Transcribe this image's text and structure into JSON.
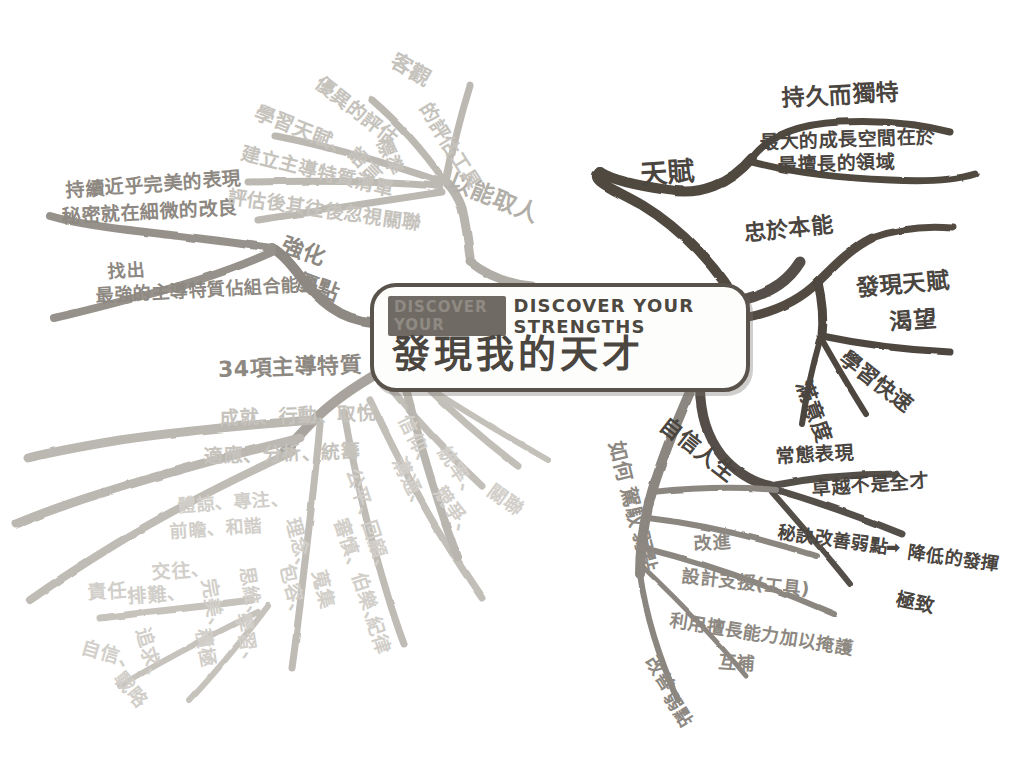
{
  "canvas": {
    "width": 1035,
    "height": 782,
    "background": "#ffffff",
    "style": "hand-drawn mind map, pencil and marker on white paper"
  },
  "palette": {
    "ink_dark": "#4a453f",
    "ink_mid": "#8d8881",
    "ink_light": "#b2aea8",
    "ink_faint": "#c6c3bd",
    "branch_dark": "#5a544d",
    "branch_mid": "#9b968f",
    "branch_light": "#bdb9b3"
  },
  "central": {
    "badge": "DISCOVER YOUR",
    "english_title": "DISCOVER YOUR STRENGTHS",
    "chinese_title": "發現我的天才"
  },
  "branches": [
    {
      "id": "talent",
      "label": "天賦",
      "direction": "top-right",
      "tone": "dark",
      "children": [
        {
          "label": "持久而獨特"
        },
        {
          "label": "最大的成長空間在於",
          "label2": "最擅長的領域"
        }
      ]
    },
    {
      "id": "instinct",
      "label": "忠於本能",
      "direction": "right-upper",
      "tone": "dark",
      "children": []
    },
    {
      "id": "discover-talent",
      "label": "發現天賦",
      "direction": "right",
      "tone": "dark",
      "children": [
        {
          "label": "渴望"
        },
        {
          "label": "學習快速"
        },
        {
          "label": "滿意度"
        }
      ]
    },
    {
      "id": "confident-life",
      "label": "自信人生",
      "direction": "right-lower",
      "tone": "dark",
      "children": [
        {
          "label": "常態表現"
        },
        {
          "label": "卓越不是全才"
        },
        {
          "label": "秘訣改善弱點",
          "arrow": "➡",
          "label2": "降低的發揮"
        },
        {
          "label": "極致"
        }
      ]
    },
    {
      "id": "manage-weakness",
      "label": "如何駕馭弱點",
      "direction": "bottom",
      "tone": "mid",
      "children": [
        {
          "label": "改進"
        },
        {
          "label": "設計支援(工具)"
        },
        {
          "label": "利用擅長能力加以掩護"
        },
        {
          "label": "互補"
        },
        {
          "label": "改善弱點"
        }
      ]
    },
    {
      "id": "34-themes",
      "label": "34項主導特質",
      "direction": "bottom-left",
      "tone": "mid",
      "children": [
        {
          "label": "成就、行動、取悅"
        },
        {
          "label": "適應、分析、統籌"
        },
        {
          "label": "體諒、專注、前瞻、和諧"
        },
        {
          "label": "理念、包容、蒐集"
        },
        {
          "label": "交往、排難"
        },
        {
          "label": "責任、自信、追求、戰略"
        },
        {
          "label": "思維、學習"
        },
        {
          "label": "完美、積極"
        },
        {
          "label": "信仰、溝通、統率、競爭、關聯"
        },
        {
          "label": "公平、審慎、回顧、伯樂、紀律"
        }
      ]
    },
    {
      "id": "strengthen",
      "label": "強化優點",
      "direction": "left",
      "tone": "mid",
      "children": [
        {
          "label": "持續近乎完美的表現",
          "label2": "秘密就在細微的改良"
        },
        {
          "label": "找出",
          "label2": "最強的主導特質佔組合能力"
        }
      ]
    },
    {
      "id": "select-by-talent",
      "label": "以能取人",
      "direction": "top",
      "tone": "light",
      "children": [
        {
          "label": "客觀的評估工具"
        },
        {
          "label": "優異的評估標準"
        },
        {
          "label": "學習天賦、語言"
        },
        {
          "label": "建立主導特質清單"
        },
        {
          "label": "評估後其往後忽視關聯"
        }
      ]
    }
  ],
  "labels": {
    "talent": "天賦",
    "lasting_unique": "持久而獨特",
    "growth_room_1": "最大的成長空間在於",
    "growth_room_2": "最擅長的領域",
    "loyal_instinct": "忠於本能",
    "discover_talent": "發現天賦",
    "desire": "渴望",
    "learn_fast": "學習快速",
    "satisfaction": "滿意度",
    "confident_life": "自信人生",
    "normal_performance": "常態表現",
    "excellence_not_allround": "卓越不是全才",
    "secret_improve_weak": "秘訣改善弱點",
    "arrow": "➡",
    "lower_play": "降低的發揮",
    "extreme": "極致",
    "manage_weakness_1": "如何",
    "manage_weakness_2": "駕馭",
    "manage_weakness_3": "弱點",
    "improve": "改進",
    "design_support": "設計支援(工具)",
    "use_strength_cover": "利用擅長能力加以掩護",
    "complement": "互補",
    "fix_weakness_1": "改善",
    "fix_weakness_2": "弱點",
    "themes34": "34項主導特質",
    "t_row1": "成就、行動、取悅",
    "t_row2": "適應、分析、統籌",
    "t_row3": "體諒、專注、",
    "t_row4": "前瞻、和諧",
    "t_col_fair": "公平、",
    "t_col_prudent": "審慎、",
    "t_col_review": "回顧、",
    "t_col_bole": "伯樂、",
    "t_col_discipline": "紀律",
    "t_col_faith": "信仰、",
    "t_col_comm": "溝通、",
    "t_col_lead": "統率、",
    "t_col_compete": "競爭、",
    "t_col_relate": "關聯",
    "t_idea": "理念、",
    "t_include": "包容、",
    "t_collect": "蒐集",
    "t_think": "思維、",
    "t_learn": "學習、",
    "t_perfect": "完美、",
    "t_positive": "積極",
    "t_social": "交往、",
    "t_resolve": "排難、",
    "t_responsible": "責任、",
    "t_confidence": "自信、",
    "t_pursue": "追求、",
    "t_strategy": "戰略",
    "strengthen_1": "強化",
    "strengthen_2": "優點",
    "near_perfect_1": "持續近乎完美的表現",
    "near_perfect_2": "秘密就在細微的改良",
    "find_out_1": "找出",
    "find_out_2": "最強的主導特質佔組合能力",
    "select_by_talent": "以能取人",
    "objective_tool_1": "客觀",
    "objective_tool_2": "的評估工具",
    "excellent_std_1": "優異的評估",
    "excellent_std_2": "標準",
    "learn_talent_lang_1": "學習天賦、",
    "learn_talent_lang_2": "語言",
    "build_list": "建立主導特質清單",
    "after_assess": "評估後其往後忽視關聯"
  }
}
